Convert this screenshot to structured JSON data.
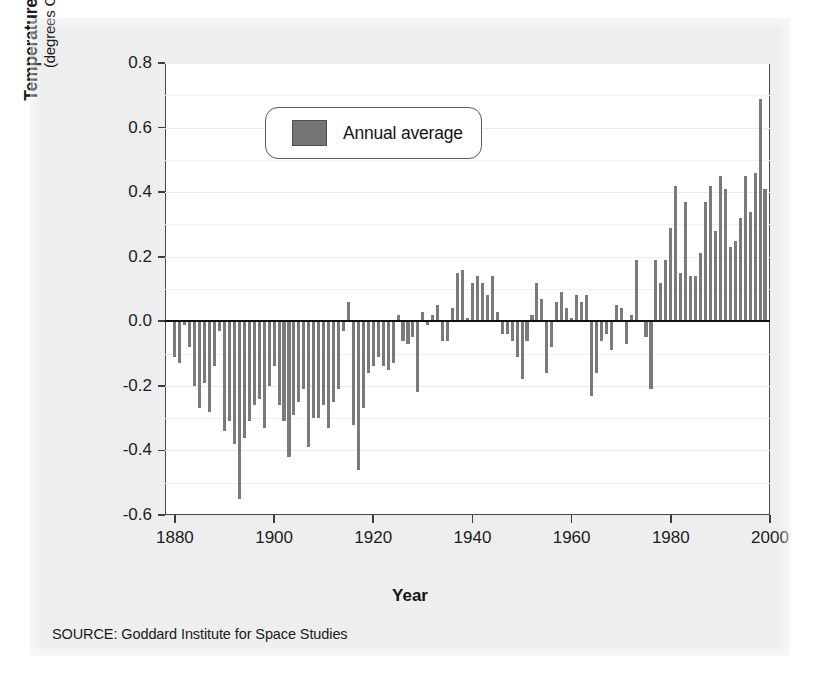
{
  "figure": {
    "source_note": "SOURCE: Goddard Institute for Space Studies",
    "legend_label": "Annual average",
    "y_title_main": "Temperature Variation",
    "y_title_sub": "(degrees Celsius)",
    "x_title": "Year",
    "bar_color": "#7a7a7a",
    "frame_color": "#4a4a4a",
    "panel_color": "#eeeeee"
  },
  "chart_data": {
    "type": "bar",
    "title": "",
    "xlabel": "Year",
    "ylabel": "Temperature Variation (degrees Celsius)",
    "legend": [
      "Annual average"
    ],
    "legend_position": "top-left-inside",
    "grid": true,
    "grid_interval": 0.1,
    "xlim": [
      1878,
      2000
    ],
    "ylim": [
      -0.6,
      0.8
    ],
    "xticks": [
      1880,
      1900,
      1920,
      1940,
      1960,
      1980,
      2000
    ],
    "yticks": [
      -0.6,
      -0.4,
      -0.2,
      0.0,
      0.2,
      0.4,
      0.6,
      0.8
    ],
    "ytick_labels": [
      "-0.6",
      "-0.4",
      "-0.2",
      "0.0",
      "0.2",
      "0.4",
      "0.6",
      "0.8"
    ],
    "xtick_labels": [
      "1880",
      "1900",
      "1920",
      "1940",
      "1960",
      "1980",
      "2000"
    ],
    "x": [
      1880,
      1881,
      1882,
      1883,
      1884,
      1885,
      1886,
      1887,
      1888,
      1889,
      1890,
      1891,
      1892,
      1893,
      1894,
      1895,
      1896,
      1897,
      1898,
      1899,
      1900,
      1901,
      1902,
      1903,
      1904,
      1905,
      1906,
      1907,
      1908,
      1909,
      1910,
      1911,
      1912,
      1913,
      1914,
      1915,
      1916,
      1917,
      1918,
      1919,
      1920,
      1921,
      1922,
      1923,
      1924,
      1925,
      1926,
      1927,
      1928,
      1929,
      1930,
      1931,
      1932,
      1933,
      1934,
      1935,
      1936,
      1937,
      1938,
      1939,
      1940,
      1941,
      1942,
      1943,
      1944,
      1945,
      1946,
      1947,
      1948,
      1949,
      1950,
      1951,
      1952,
      1953,
      1954,
      1955,
      1956,
      1957,
      1958,
      1959,
      1960,
      1961,
      1962,
      1963,
      1964,
      1965,
      1966,
      1967,
      1968,
      1969,
      1970,
      1971,
      1972,
      1973,
      1974,
      1975,
      1976,
      1977,
      1978,
      1979,
      1980,
      1981,
      1982,
      1983,
      1984,
      1985,
      1986,
      1987,
      1988,
      1989,
      1990,
      1991,
      1992,
      1993,
      1994,
      1995,
      1996,
      1997,
      1998,
      1999
    ],
    "values": [
      -0.11,
      -0.13,
      -0.01,
      -0.08,
      -0.2,
      -0.27,
      -0.19,
      -0.28,
      -0.14,
      -0.03,
      -0.34,
      -0.31,
      -0.38,
      -0.55,
      -0.36,
      -0.31,
      -0.26,
      -0.24,
      -0.33,
      -0.2,
      -0.14,
      -0.26,
      -0.31,
      -0.42,
      -0.29,
      -0.25,
      -0.21,
      -0.39,
      -0.3,
      -0.3,
      -0.26,
      -0.33,
      -0.25,
      -0.21,
      -0.03,
      0.06,
      -0.32,
      -0.46,
      -0.27,
      -0.16,
      -0.14,
      -0.11,
      -0.14,
      -0.15,
      -0.13,
      0.02,
      -0.06,
      -0.07,
      -0.05,
      -0.22,
      0.03,
      -0.01,
      0.02,
      0.05,
      -0.06,
      -0.06,
      0.04,
      0.15,
      0.16,
      0.01,
      0.12,
      0.14,
      0.12,
      0.08,
      0.14,
      0.03,
      -0.04,
      -0.04,
      -0.06,
      -0.11,
      -0.18,
      -0.06,
      0.02,
      0.12,
      0.07,
      -0.16,
      -0.08,
      0.06,
      0.09,
      0.04,
      0.01,
      0.08,
      0.06,
      0.08,
      -0.23,
      -0.16,
      -0.06,
      -0.04,
      -0.09,
      0.05,
      0.04,
      -0.07,
      0.02,
      0.19,
      0.0,
      -0.05,
      -0.21,
      0.19,
      0.12,
      0.19,
      0.29,
      0.42,
      0.15,
      0.37,
      0.14,
      0.14,
      0.21,
      0.37,
      0.42,
      0.28,
      0.45,
      0.41,
      0.23,
      0.25,
      0.32,
      0.45,
      0.34,
      0.46,
      0.69,
      0.41
    ],
    "annotations": [
      {
        "text": "SOURCE: Goddard Institute for Space Studies",
        "position": "below-axis-left"
      }
    ]
  }
}
